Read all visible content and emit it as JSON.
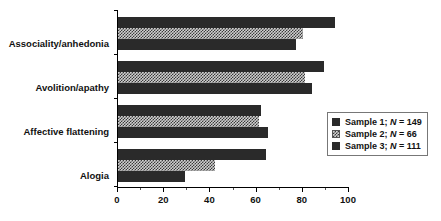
{
  "chart_data": {
    "type": "bar",
    "orientation": "horizontal",
    "title": "",
    "xlabel": "",
    "ylabel": "",
    "xlim": [
      0,
      100
    ],
    "xticks": [
      0,
      20,
      40,
      60,
      80,
      100
    ],
    "xtick_labels": [
      "0",
      "20",
      "40",
      "60",
      "80",
      "100"
    ],
    "grid": false,
    "legend_position": "center-right",
    "categories": [
      "Associality/anhedonia",
      "Avolition/apathy",
      "Affective flattening",
      "Alogia"
    ],
    "series": [
      {
        "name": "Sample 1; N = 149",
        "values": [
          94,
          89,
          62,
          64
        ]
      },
      {
        "name": "Sample 2; N = 66",
        "values": [
          80,
          81,
          61,
          42
        ]
      },
      {
        "name": "Sample 3; N = 111",
        "values": [
          77,
          84,
          65,
          29
        ]
      }
    ]
  },
  "legend": {
    "items": [
      {
        "label_prefix": "Sample 1;",
        "label_n": "N",
        "label_suffix": "= 149",
        "swatch": "solid-dark"
      },
      {
        "label_prefix": "Sample 2;",
        "label_n": "N",
        "label_suffix": "= 66",
        "swatch": "hatched-light"
      },
      {
        "label_prefix": "Sample 3;",
        "label_n": "N",
        "label_suffix": "= 111",
        "swatch": "solid-dark"
      }
    ]
  },
  "colors": {
    "series1": "#2a2a2a",
    "series2": "#cfcfcf",
    "series3": "#2a2a2a",
    "axis": "#000000",
    "text": "#111111"
  }
}
